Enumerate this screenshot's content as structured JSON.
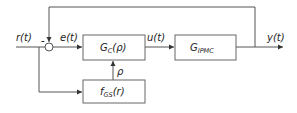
{
  "diagram": {
    "type": "gain-scheduled feedback control loop",
    "signals": {
      "reference": "r(t)",
      "error": "e(t)",
      "control": "u(t)",
      "output": "y(t)",
      "schedule": "ρ"
    },
    "summing_junction": {
      "feedback_sign": "-"
    },
    "blocks": {
      "controller": {
        "main": "G",
        "sub": "C",
        "arg": "(ρ)"
      },
      "plant": {
        "main": "G",
        "sub": "IPMC"
      },
      "scheduler": {
        "main": "f",
        "sub": "GS",
        "arg": "(r)"
      }
    },
    "colors": {
      "line": "#555555",
      "box_border": "#666666",
      "text": "#222222"
    }
  }
}
